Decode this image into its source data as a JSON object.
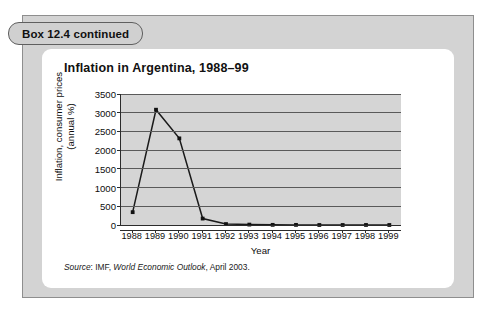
{
  "box_tag": {
    "label": "Box 12.4 continued"
  },
  "card": {
    "title": "Inflation in Argentina, 1988–99",
    "source_prefix": "Source",
    "source_sep": ": IMF, ",
    "source_title": "World Economic Outlook",
    "source_suffix": ", April 2003."
  },
  "colors": {
    "outer_box_fill": "#d3d3d3",
    "outer_box_border": "#8e8e8e",
    "card_fill": "#ffffff",
    "plot_fill": "#d5d5d5",
    "gridline": "#5a5a5a",
    "axis": "#2b2b2b",
    "series_line": "#1a1a1a",
    "marker": "#111111",
    "tag_fill": "#d0d0d0",
    "tag_border": "#5f5f5f"
  },
  "chart_data": {
    "type": "line",
    "title": "Inflation in Argentina, 1988–99",
    "xlabel": "Year",
    "ylabel": "Inflation, consumer prices (annual %)",
    "ylabel_line1": "Inflation, consumer prices",
    "ylabel_line2": "(annual %)",
    "categories": [
      "1988",
      "1989",
      "1990",
      "1991",
      "1992",
      "1993",
      "1994",
      "1995",
      "1996",
      "1997",
      "1998",
      "1999"
    ],
    "x": [
      1988,
      1989,
      1990,
      1991,
      1992,
      1993,
      1994,
      1995,
      1996,
      1997,
      1998,
      1999
    ],
    "values": [
      343,
      3080,
      2314,
      172,
      25,
      11,
      4,
      3,
      0,
      0,
      1,
      -1
    ],
    "yticks": [
      0,
      500,
      1000,
      1500,
      2000,
      2500,
      3000,
      3500
    ],
    "ytick_labels": [
      "0",
      "500",
      "1000",
      "1500",
      "2000",
      "2500",
      "3000",
      "3500"
    ],
    "ylim": [
      0,
      3500
    ],
    "grid": true,
    "legend": "none",
    "marker": "square",
    "series": [
      {
        "name": "Inflation, consumer prices (annual %)",
        "values": [
          343,
          3080,
          2314,
          172,
          25,
          11,
          4,
          3,
          0,
          0,
          1,
          -1
        ]
      }
    ]
  }
}
